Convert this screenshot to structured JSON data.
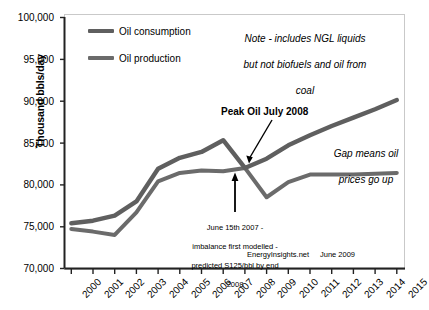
{
  "chart_data": {
    "type": "line",
    "title": "",
    "xlabel": "",
    "ylabel": "Thousand bbls/day",
    "xlim": [
      2000,
      2015
    ],
    "ylim": [
      70000,
      100000
    ],
    "ytick_labels": [
      "100,000",
      "95,000",
      "90,000",
      "85,000",
      "80,000",
      "75,000",
      "70,000"
    ],
    "ytick_values": [
      100000,
      95000,
      90000,
      85000,
      80000,
      75000,
      70000
    ],
    "grid": false,
    "legend_position": "top-left",
    "categories": [
      "2000",
      "2001",
      "2002",
      "2003",
      "2004",
      "2005",
      "2006",
      "2007",
      "2008",
      "2009",
      "2010",
      "2011",
      "2012",
      "2013",
      "2014",
      "2015"
    ],
    "x": [
      2000,
      2001,
      2002,
      2003,
      2004,
      2005,
      2006,
      2007,
      2008,
      2009,
      2010,
      2011,
      2012,
      2013,
      2014,
      2015
    ],
    "series": [
      {
        "name": "Oil consumption",
        "color": "#5f5f5f",
        "values": [
          75400,
          75700,
          76300,
          78000,
          81900,
          83200,
          83900,
          85300,
          82000,
          83100,
          84700,
          85900,
          87000,
          88000,
          89000,
          90100
        ]
      },
      {
        "name": "Oil production",
        "color": "#6b6b6b",
        "values": [
          74700,
          74400,
          74000,
          76700,
          80400,
          81400,
          81700,
          81600,
          82000,
          78500,
          80300,
          81200,
          81200,
          81200,
          81300,
          81400
        ]
      }
    ],
    "annotations": [
      {
        "name": "note",
        "text": "Note - includes NGL liquids but not biofuels and oil from coal"
      },
      {
        "name": "peak-oil",
        "text": "Peak Oil July 2008",
        "points_to_x": 2008,
        "points_to_y": 82000
      },
      {
        "name": "gap",
        "text": "Gap means oil prices go up"
      },
      {
        "name": "imbalance",
        "text": "June 15th 2007 - imbalance first modelled - predicted S125/bbl by end 2008",
        "points_to_x": 2007.5,
        "points_to_y": 81600
      }
    ]
  },
  "legend": {
    "items": [
      {
        "label": "Oil consumption",
        "color": "#5f5f5f"
      },
      {
        "label": "Oil production",
        "color": "#6b6b6b"
      }
    ]
  },
  "axis": {
    "y_title": "Thousand bbls/day",
    "y_ticks": [
      "100,000",
      "95,000",
      "90,000",
      "85,000",
      "80,000",
      "75,000",
      "70,000"
    ],
    "x_ticks": [
      "2000",
      "2001",
      "2002",
      "2003",
      "2004",
      "2005",
      "2006",
      "2007",
      "2008",
      "2009",
      "2010",
      "2011",
      "2012",
      "2013",
      "2014",
      "2015"
    ]
  },
  "annotations": {
    "note_line1": "Note - includes NGL liquids",
    "note_line2": "but not biofuels and oil from",
    "note_line3": "coal",
    "peak_label": "Peak Oil July 2008",
    "gap_line1": "Gap means oil",
    "gap_line2": "prices go up",
    "imbalance_line1": "June 15th 2007 -",
    "imbalance_line2": "imbalance first modelled -",
    "imbalance_line3": "predicted S125/bbl by end",
    "imbalance_line4": "2008",
    "credit_source": "EnergyInsights.net",
    "credit_date": "June 2009"
  },
  "colors": {
    "consumption": "#5f5f5f",
    "production": "#6b6b6b",
    "frame": "#c9c9c9",
    "axis": "#222222",
    "text": "#000000"
  }
}
